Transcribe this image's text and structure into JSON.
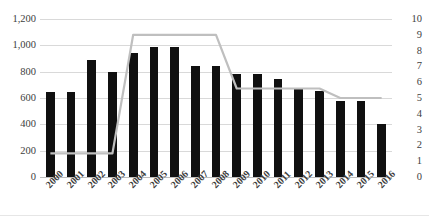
{
  "chart": {
    "title_clipped": "",
    "background_color": "#ffffff",
    "bar_color": "#101010",
    "line_color": "#bfbfbf",
    "gridline_color": "#d9d9d9"
  },
  "chart_data": {
    "type": "bar",
    "title": "",
    "xlabel": "",
    "ylabel": "",
    "grid": true,
    "legend": "none",
    "categories": [
      "2000",
      "2001",
      "2002",
      "2003",
      "2004",
      "2005",
      "2006",
      "2007",
      "2008",
      "2009",
      "2010",
      "2011",
      "2012",
      "2013",
      "2014",
      "2015",
      "2016"
    ],
    "series": [
      {
        "name": "bars",
        "type": "bar",
        "axis": "left",
        "values": [
          645,
          645,
          890,
          795,
          945,
          990,
          990,
          840,
          840,
          785,
          785,
          745,
          675,
          655,
          575,
          575,
          400
        ]
      },
      {
        "name": "line",
        "type": "line",
        "axis": "right",
        "values": [
          1.5,
          1.5,
          1.5,
          1.5,
          9.0,
          9.0,
          9.0,
          9.0,
          9.0,
          5.6,
          5.6,
          5.6,
          5.6,
          5.6,
          5.0,
          5.0,
          5.0
        ]
      }
    ],
    "y_left": {
      "ticks": [
        "0",
        "200",
        "400",
        "600",
        "800",
        "1,000",
        "1,200"
      ],
      "values": [
        0,
        200,
        400,
        600,
        800,
        1000,
        1200
      ],
      "ylim": [
        0,
        1200
      ]
    },
    "y_right": {
      "ticks": [
        "0",
        "1",
        "2",
        "3",
        "4",
        "5",
        "6",
        "7",
        "8",
        "9",
        "10"
      ],
      "values": [
        0,
        1,
        2,
        3,
        4,
        5,
        6,
        7,
        8,
        9,
        10
      ],
      "ylim": [
        0,
        10
      ]
    }
  }
}
